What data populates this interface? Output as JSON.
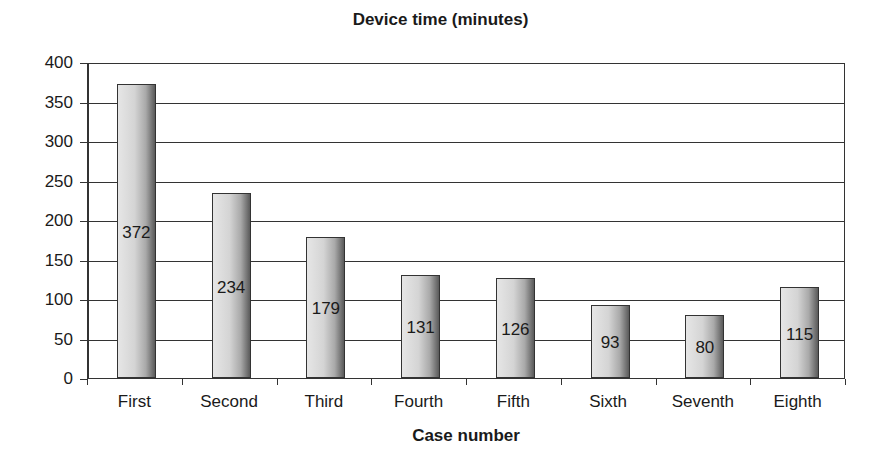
{
  "chart_data": {
    "type": "bar",
    "title": "Device time (minutes)",
    "xlabel": "Case number",
    "ylabel": "",
    "categories": [
      "First",
      "Second",
      "Third",
      "Fourth",
      "Fifth",
      "Sixth",
      "Seventh",
      "Eighth"
    ],
    "values": [
      372,
      234,
      179,
      131,
      126,
      93,
      80,
      115
    ],
    "data_labels": [
      "372",
      "234",
      "179",
      "131",
      "126",
      "93",
      "80",
      "115"
    ],
    "ylim": [
      0,
      400
    ],
    "yticks": [
      "0",
      "50",
      "100",
      "150",
      "200",
      "250",
      "300",
      "350",
      "400"
    ],
    "grid": true,
    "legend": null,
    "bar_color": "#c8c8c8"
  }
}
